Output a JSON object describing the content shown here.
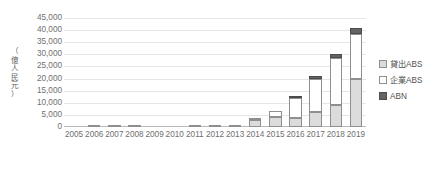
{
  "chart_data": {
    "type": "bar",
    "stacked": true,
    "title": "",
    "xlabel": "",
    "ylabel": "（億人民元）",
    "ylim": [
      0,
      45000
    ],
    "ytick_step": 5000,
    "ytick_labels": [
      "45,000",
      "40,000",
      "35,000",
      "30,000",
      "25,000",
      "20,000",
      "15,000",
      "10,000",
      "5,000",
      "0"
    ],
    "ytick_values": [
      45000,
      40000,
      35000,
      30000,
      25000,
      20000,
      15000,
      10000,
      5000,
      0
    ],
    "grid": true,
    "legend_position": "right",
    "categories": [
      "2005",
      "2006",
      "2007",
      "2008",
      "2009",
      "2010",
      "2011",
      "2012",
      "2013",
      "2014",
      "2015",
      "2016",
      "2017",
      "2018",
      "2019"
    ],
    "series": [
      {
        "name": "貸出ABS",
        "color": "#dcdcdc",
        "values": [
          0,
          60,
          180,
          300,
          0,
          0,
          50,
          190,
          160,
          2800,
          4000,
          3900,
          6000,
          9000,
          20000
        ]
      },
      {
        "name": "企業ABS",
        "color": "#ffffff",
        "values": [
          0,
          0,
          0,
          0,
          0,
          0,
          0,
          0,
          0,
          200,
          2800,
          8200,
          14000,
          19500,
          18500
        ]
      },
      {
        "name": "ABN",
        "color": "#646464",
        "values": [
          0,
          0,
          0,
          0,
          0,
          0,
          0,
          0,
          0,
          0,
          0,
          400,
          1000,
          1500,
          2500
        ]
      }
    ],
    "totals": [
      0,
      60,
      180,
      300,
      0,
      0,
      50,
      190,
      160,
      3000,
      6800,
      12500,
      21000,
      30000,
      41000
    ]
  },
  "legend": {
    "items": [
      {
        "label": "貸出ABS",
        "swatch": "loan"
      },
      {
        "label": "企業ABS",
        "swatch": "corp"
      },
      {
        "label": "ABN",
        "swatch": "abn"
      }
    ]
  },
  "axis": {
    "y_title_text": "（億人民元）"
  }
}
